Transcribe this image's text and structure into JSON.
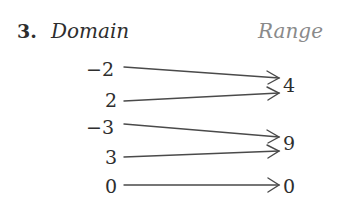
{
  "problem": {
    "number": "3.",
    "domain_label": "Domain",
    "range_label": "Range"
  },
  "domain": [
    "−2",
    "2",
    "−3",
    "3",
    "0"
  ],
  "range": [
    "4",
    "9",
    "0"
  ],
  "mapping": [
    {
      "from": "−2",
      "to": "4"
    },
    {
      "from": "2",
      "to": "4"
    },
    {
      "from": "−3",
      "to": "9"
    },
    {
      "from": "3",
      "to": "9"
    },
    {
      "from": "0",
      "to": "0"
    }
  ],
  "colors": {
    "text": "#2e2e2e",
    "range_label": "#8a8a8a",
    "arrow": "#4a4a4a"
  }
}
